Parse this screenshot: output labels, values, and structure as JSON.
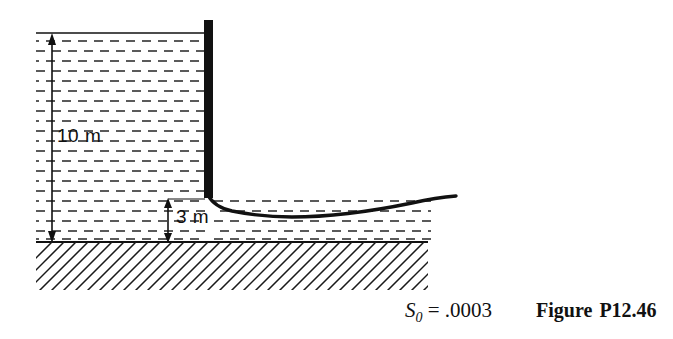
{
  "figure": {
    "caption_prefix": "Figure",
    "caption_number": "P12.46",
    "slope": {
      "symbol": "S",
      "subscript": "0",
      "equals": "=",
      "value": ".0003",
      "full_text": "S0 = .0003"
    },
    "dimensions": [
      {
        "name": "upstream-depth",
        "label": "10 m",
        "value": 10,
        "unit": "m"
      },
      {
        "name": "downstream-depth",
        "label": "3 m",
        "value": 3,
        "unit": "m"
      }
    ],
    "elements": {
      "gate": "sluice-gate",
      "ground": "channel-bed-hatching",
      "water": "water-dash-fill",
      "jet": "water-surface-profile",
      "water_surface": "upstream-free-surface"
    },
    "colors": {
      "ink": "#111111",
      "water_dash": "#5a5a5a",
      "hatch": "#1a1a1a",
      "background": "#ffffff"
    }
  }
}
